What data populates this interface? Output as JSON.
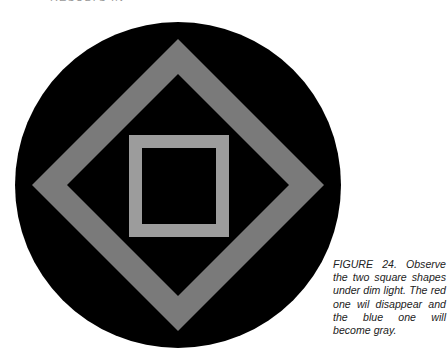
{
  "header_fragment": "RESULTS IN",
  "figure": {
    "background": "#000000",
    "shape_color": "#7a7a7a",
    "inner_square_color": "#9a9a9a",
    "circle": {
      "cx": 178,
      "cy": 185,
      "r": 163
    },
    "diamond": {
      "cx": 178,
      "cy": 185,
      "outer": 146,
      "inner": 111
    },
    "square": {
      "outer": [
        129,
        135,
        100,
        102
      ],
      "inner": [
        142,
        148,
        74,
        76
      ]
    }
  },
  "caption": {
    "label": "FIGURE 24.",
    "text": "FIGURE 24. Observe the two square shapes under dim light. The red one wil disappear and the blue one will become gray."
  }
}
